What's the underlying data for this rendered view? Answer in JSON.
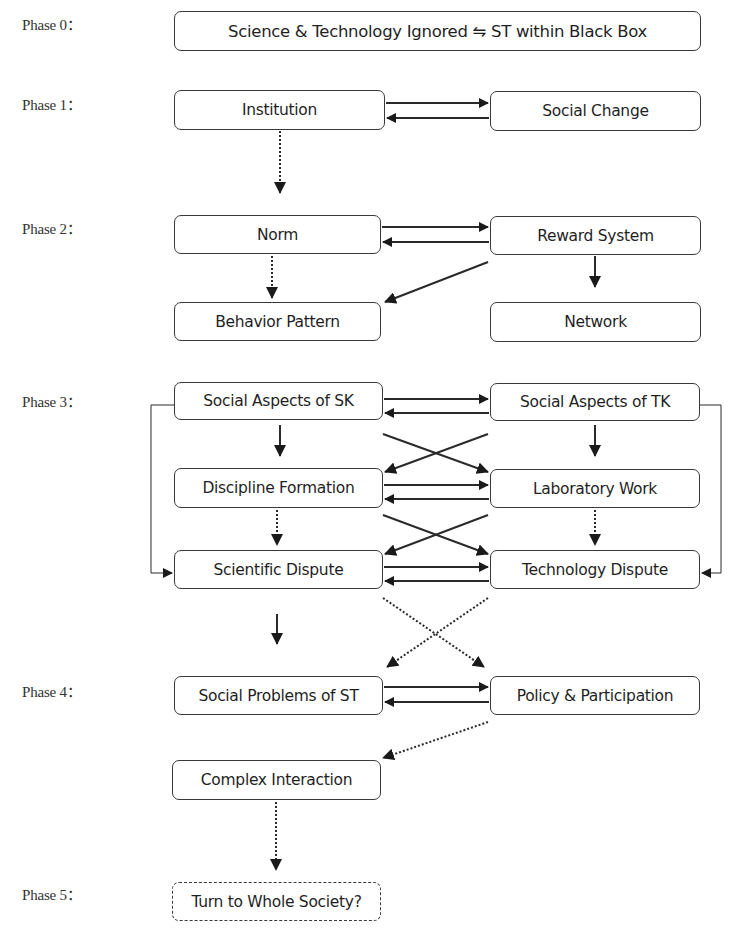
{
  "phases": [
    {
      "label": "Phase 0："
    },
    {
      "label": "Phase 1："
    },
    {
      "label": "Phase 2："
    },
    {
      "label": "Phase 3："
    },
    {
      "label": "Phase 4："
    },
    {
      "label": "Phase 5："
    }
  ],
  "nodes": {
    "phase0": "Science & Technology Ignored ⇋ ST within Black Box",
    "institution": "Institution",
    "social_change": "Social Change",
    "norm": "Norm",
    "reward_system": "Reward System",
    "behavior_pattern": "Behavior Pattern",
    "network": "Network",
    "social_aspects_sk": "Social Aspects of SK",
    "social_aspects_tk": "Social Aspects of TK",
    "discipline_formation": "Discipline Formation",
    "laboratory_work": "Laboratory Work",
    "scientific_dispute": "Scientific Dispute",
    "technology_dispute": "Technology Dispute",
    "social_problems_st": "Social Problems of ST",
    "policy_participation": "Policy & Participation",
    "complex_interaction": "Complex Interaction",
    "whole_society": "Turn to Whole Society?"
  },
  "edges": [
    {
      "from": "institution",
      "to": "social_change",
      "style": "solid"
    },
    {
      "from": "social_change",
      "to": "institution",
      "style": "solid"
    },
    {
      "from": "institution",
      "to": "norm",
      "style": "dotted"
    },
    {
      "from": "norm",
      "to": "reward_system",
      "style": "solid"
    },
    {
      "from": "reward_system",
      "to": "norm",
      "style": "solid"
    },
    {
      "from": "norm",
      "to": "behavior_pattern",
      "style": "dotted"
    },
    {
      "from": "reward_system",
      "to": "behavior_pattern",
      "style": "solid"
    },
    {
      "from": "reward_system",
      "to": "network",
      "style": "solid"
    },
    {
      "from": "social_aspects_sk",
      "to": "social_aspects_tk",
      "style": "solid"
    },
    {
      "from": "social_aspects_tk",
      "to": "social_aspects_sk",
      "style": "solid"
    },
    {
      "from": "social_aspects_sk",
      "to": "discipline_formation",
      "style": "solid"
    },
    {
      "from": "social_aspects_sk",
      "to": "laboratory_work",
      "style": "solid"
    },
    {
      "from": "social_aspects_tk",
      "to": "discipline_formation",
      "style": "solid"
    },
    {
      "from": "social_aspects_tk",
      "to": "laboratory_work",
      "style": "solid"
    },
    {
      "from": "social_aspects_sk",
      "to": "scientific_dispute",
      "style": "thin"
    },
    {
      "from": "social_aspects_tk",
      "to": "technology_dispute",
      "style": "thin"
    },
    {
      "from": "discipline_formation",
      "to": "laboratory_work",
      "style": "solid"
    },
    {
      "from": "laboratory_work",
      "to": "discipline_formation",
      "style": "solid"
    },
    {
      "from": "discipline_formation",
      "to": "scientific_dispute",
      "style": "dotted"
    },
    {
      "from": "discipline_formation",
      "to": "technology_dispute",
      "style": "solid"
    },
    {
      "from": "laboratory_work",
      "to": "scientific_dispute",
      "style": "solid"
    },
    {
      "from": "laboratory_work",
      "to": "technology_dispute",
      "style": "dotted"
    },
    {
      "from": "scientific_dispute",
      "to": "technology_dispute",
      "style": "solid"
    },
    {
      "from": "technology_dispute",
      "to": "scientific_dispute",
      "style": "solid"
    },
    {
      "from": "scientific_dispute",
      "to": "social_problems_st",
      "style": "solid"
    },
    {
      "from": "scientific_dispute",
      "to": "policy_participation",
      "style": "dotted"
    },
    {
      "from": "technology_dispute",
      "to": "social_problems_st",
      "style": "dotted"
    },
    {
      "from": "social_problems_st",
      "to": "policy_participation",
      "style": "solid"
    },
    {
      "from": "policy_participation",
      "to": "social_problems_st",
      "style": "solid"
    },
    {
      "from": "policy_participation",
      "to": "complex_interaction",
      "style": "dotted"
    },
    {
      "from": "complex_interaction",
      "to": "whole_society",
      "style": "dotted"
    }
  ],
  "colors": {
    "line": "#2a2a2a",
    "border": "#3a3a3a",
    "text": "#1f1f1f"
  }
}
